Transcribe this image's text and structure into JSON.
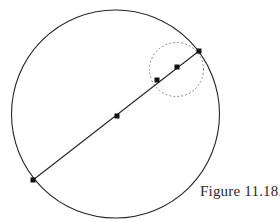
{
  "figure": {
    "caption": "Figure 11.18.",
    "caption_position": {
      "x": 200,
      "y": 183
    },
    "background_color": "#ffffff",
    "stroke_color": "#262626",
    "dotted_stroke_color": "#7a7a7a",
    "marker_color": "#111111",
    "canvas": {
      "width": 280,
      "height": 222
    }
  },
  "chart_data": {
    "type": "diagram",
    "title": "Figure 11.18.",
    "shapes": [
      {
        "name": "main-circle",
        "kind": "circle",
        "cx": 115.5,
        "cy": 114,
        "r": 104,
        "stroke": "#262626",
        "stroke_width": 1.1,
        "dashed": false,
        "fill": "none"
      },
      {
        "name": "highlight-circle",
        "kind": "circle",
        "cx": 176.5,
        "cy": 69.5,
        "r": 27,
        "stroke": "#7a7a7a",
        "stroke_width": 1.0,
        "dashed": true,
        "dash_pattern": "0.9 3.1",
        "fill": "none"
      },
      {
        "name": "chord-line",
        "kind": "line",
        "x1": 33,
        "y1": 180,
        "x2": 199,
        "y2": 51,
        "stroke": "#262626",
        "stroke_width": 1.1
      }
    ],
    "points": [
      {
        "name": "chord-endpoint-lower-left",
        "x": 33,
        "y": 180,
        "size": 5
      },
      {
        "name": "chord-midpoint",
        "x": 117,
        "y": 116,
        "size": 5
      },
      {
        "name": "chord-point-inner",
        "x": 157,
        "y": 80,
        "size": 5
      },
      {
        "name": "chord-point-outer",
        "x": 177,
        "y": 67,
        "size": 5
      },
      {
        "name": "chord-endpoint-upper-right",
        "x": 199,
        "y": 51,
        "size": 5
      }
    ],
    "xlabel": "",
    "ylabel": "",
    "grid": false,
    "legend": false
  }
}
